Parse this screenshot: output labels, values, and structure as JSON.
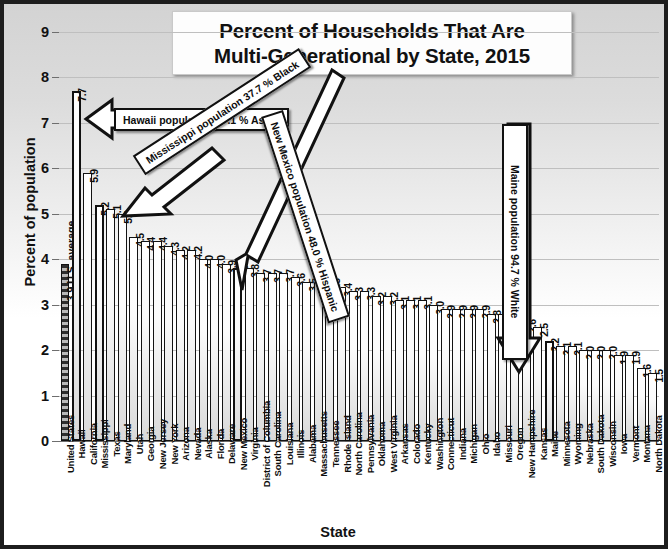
{
  "chart_data": {
    "type": "bar",
    "title": "Percent of Households That Are Multi-Generational by State, 2015",
    "title_line1": "Percent of Households That Are",
    "title_line2": "Multi-Generational by State, 2015",
    "xlabel": "State",
    "ylabel": "Percent of population",
    "ylim": [
      0,
      9
    ],
    "yticks": [
      0,
      1,
      2,
      3,
      4,
      5,
      6,
      7,
      8,
      9
    ],
    "ytick_labels": [
      "0",
      "1",
      "2",
      "3",
      "4",
      "5",
      "6",
      "7",
      "8",
      "9"
    ],
    "grid": "horizontal",
    "legend": "none",
    "us_average_note": "3.9  U.S. average",
    "categories": [
      "United States",
      "Hawaii",
      "California",
      "Mississippi",
      "Texas",
      "Maryland",
      "Utah",
      "Georgia",
      "New Jersey",
      "New York",
      "Arizona",
      "Nevada",
      "Alaska",
      "Florida",
      "Delaware",
      "New Mexico",
      "Virginia",
      "District of Columbia",
      "South Carolina",
      "Louisiana",
      "Illinois",
      "Alabama",
      "Massachusetts",
      "Tennessee",
      "Rhode Island",
      "North Carolina",
      "Pennsylvania",
      "Oklahoma",
      "West Virginia",
      "Arkansas",
      "Colorado",
      "Kentucky",
      "Washington",
      "Connecticut",
      "Indiana",
      "Michigan",
      "Ohio",
      "Idaho",
      "Missouri",
      "Oregon",
      "New Hampshire",
      "Kansas",
      "Maine",
      "Minnesota",
      "Wyoming",
      "Nebraska",
      "South Dakota",
      "Wisconsin",
      "Iowa",
      "Vermont",
      "Montana",
      "North Dakota"
    ],
    "values": [
      3.9,
      7.7,
      5.9,
      5.2,
      5.1,
      5.0,
      4.5,
      4.4,
      4.4,
      4.3,
      4.2,
      4.2,
      4.0,
      4.0,
      3.9,
      3.8,
      3.8,
      3.7,
      3.7,
      3.7,
      3.6,
      3.5,
      3.5,
      3.5,
      3.4,
      3.3,
      3.3,
      3.2,
      3.2,
      3.1,
      3.1,
      3.1,
      3.0,
      2.9,
      2.9,
      2.9,
      2.9,
      2.8,
      2.8,
      2.7,
      2.6,
      2.5,
      2.2,
      2.1,
      2.1,
      2.0,
      2.0,
      2.0,
      1.9,
      1.9,
      1.6,
      1.5
    ],
    "value_labels": [
      "3.9",
      "7.7",
      "5.9",
      "5.2",
      "5.1",
      "5.0",
      "4.5",
      "4.4",
      "4.4",
      "4.3",
      "4.2",
      "4.2",
      "4.0",
      "4.0",
      "3.9",
      "3.8",
      "3.8",
      "3.7",
      "3.7",
      "3.7",
      "3.6",
      "3.5",
      "3.5",
      "3.5",
      "3.4",
      "3.3",
      "3.3",
      "3.2",
      "3.2",
      "3.1",
      "3.1",
      "3.1",
      "3.0",
      "2.9",
      "2.9",
      "2.9",
      "2.9",
      "2.8",
      "2.8",
      "2.7",
      "2.6",
      "2.5",
      "2.2",
      "2.1",
      "2.1",
      "2.0",
      "2.0",
      "2.0",
      "1.9",
      "1.9",
      "1.6",
      "1.5"
    ],
    "highlighted_categories": [
      "Hawaii",
      "Mississippi",
      "New Mexico",
      "Maine"
    ],
    "annotations": [
      {
        "id": "hawaii",
        "text": "Hawaii population 37.1 % Asian",
        "target": "Hawaii"
      },
      {
        "id": "mississippi",
        "text": "Mississippi population 37.7 % Black",
        "target": "Mississippi"
      },
      {
        "id": "newmexico",
        "text": "New Mexico population 48.0 % Hispanic",
        "target": "New Mexico"
      },
      {
        "id": "maine",
        "text": "Maine population 94.7 % White",
        "target": "Maine"
      }
    ]
  },
  "colors": {
    "frame_border": "#1d1d1d",
    "bar_outline": "#131313",
    "gridline": "#bfbfbf",
    "text": "#0d0d0d",
    "callout_fill": "#ffffff"
  }
}
